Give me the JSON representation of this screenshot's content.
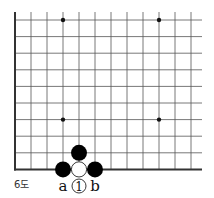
{
  "diagram": {
    "type": "go-board-fragment",
    "caption": "6도",
    "grid": {
      "columns": 12,
      "rows": 10,
      "origin_x": 15,
      "origin_y": 20,
      "spacing_x": 16,
      "spacing_y": 16.6,
      "right_extent_x": 202,
      "line_color": "#555555",
      "edge_color": "#333333",
      "left_edge": true,
      "bottom_edge": true
    },
    "hoshi": [
      {
        "col": 3,
        "row": 0
      },
      {
        "col": 9,
        "row": 0
      },
      {
        "col": 3,
        "row": 6
      },
      {
        "col": 9,
        "row": 6
      }
    ],
    "stones": [
      {
        "color": "black",
        "col": 4,
        "row": 8
      },
      {
        "color": "black",
        "col": 3,
        "row": 9
      },
      {
        "color": "white",
        "col": 4,
        "row": 9
      },
      {
        "color": "black",
        "col": 5,
        "row": 9
      }
    ],
    "edge_marks": [
      {
        "type": "numbered-white",
        "col": 4,
        "label": "1"
      },
      {
        "type": "letter",
        "col": 3,
        "label": "a"
      },
      {
        "type": "letter",
        "col": 5,
        "label": "b"
      }
    ]
  }
}
